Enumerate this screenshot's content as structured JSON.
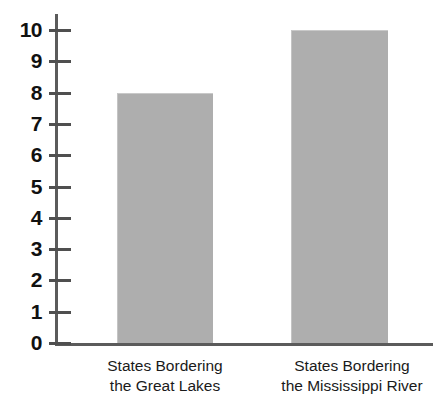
{
  "chart_data": {
    "type": "bar",
    "title": "",
    "subtitle": "",
    "xlabel": "",
    "ylabel": "",
    "categories": [
      "States Bordering the Great Lakes",
      "States Bordering the Mississippi River"
    ],
    "category_lines": [
      [
        "States Bordering",
        "the Great Lakes"
      ],
      [
        "States Bordering",
        "the Mississippi River"
      ]
    ],
    "values": [
      8,
      10
    ],
    "ylim": [
      0,
      10
    ],
    "ytick_labels": [
      "0",
      "1",
      "2",
      "3",
      "4",
      "5",
      "6",
      "7",
      "8",
      "9",
      "10"
    ],
    "ytick_values": [
      0,
      1,
      2,
      3,
      4,
      5,
      6,
      7,
      8,
      9,
      10
    ],
    "grid": false,
    "legend": null,
    "legend_position": "none",
    "bar_color": "#aeaeae",
    "axis_color": "#5b5b5b",
    "text_color": "#111111"
  }
}
